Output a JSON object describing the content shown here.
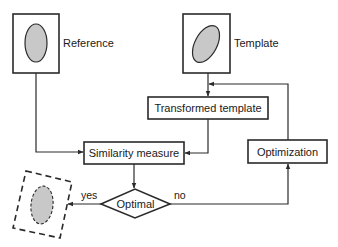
{
  "diagram": {
    "type": "flowchart",
    "colors": {
      "stroke": "#2a2a2a",
      "ellipse_fill": "#c8c8c8",
      "background": "#ffffff"
    },
    "nodes": {
      "reference": {
        "label": "Reference",
        "shape": "image-box-ellipse-vertical"
      },
      "template": {
        "label": "Template",
        "shape": "image-box-ellipse-tilted"
      },
      "transformed": {
        "label": "Transformed template",
        "shape": "rectangle"
      },
      "similarity": {
        "label": "Similarity measure",
        "shape": "rectangle"
      },
      "optimization": {
        "label": "Optimization",
        "shape": "rectangle"
      },
      "optimal": {
        "label": "Optimal",
        "shape": "diamond"
      },
      "result": {
        "label": "",
        "shape": "dashed-rotated-box-ellipse"
      }
    },
    "edges": [
      {
        "from": "reference",
        "to": "similarity",
        "label": ""
      },
      {
        "from": "template",
        "to": "transformed",
        "label": ""
      },
      {
        "from": "transformed",
        "to": "similarity",
        "label": ""
      },
      {
        "from": "similarity",
        "to": "optimal",
        "label": ""
      },
      {
        "from": "optimal",
        "to": "result",
        "label": "yes"
      },
      {
        "from": "optimal",
        "to": "optimization",
        "label": "no"
      },
      {
        "from": "optimization",
        "to": "transformed",
        "label": ""
      }
    ],
    "edge_labels": {
      "yes": "yes",
      "no": "no"
    }
  }
}
